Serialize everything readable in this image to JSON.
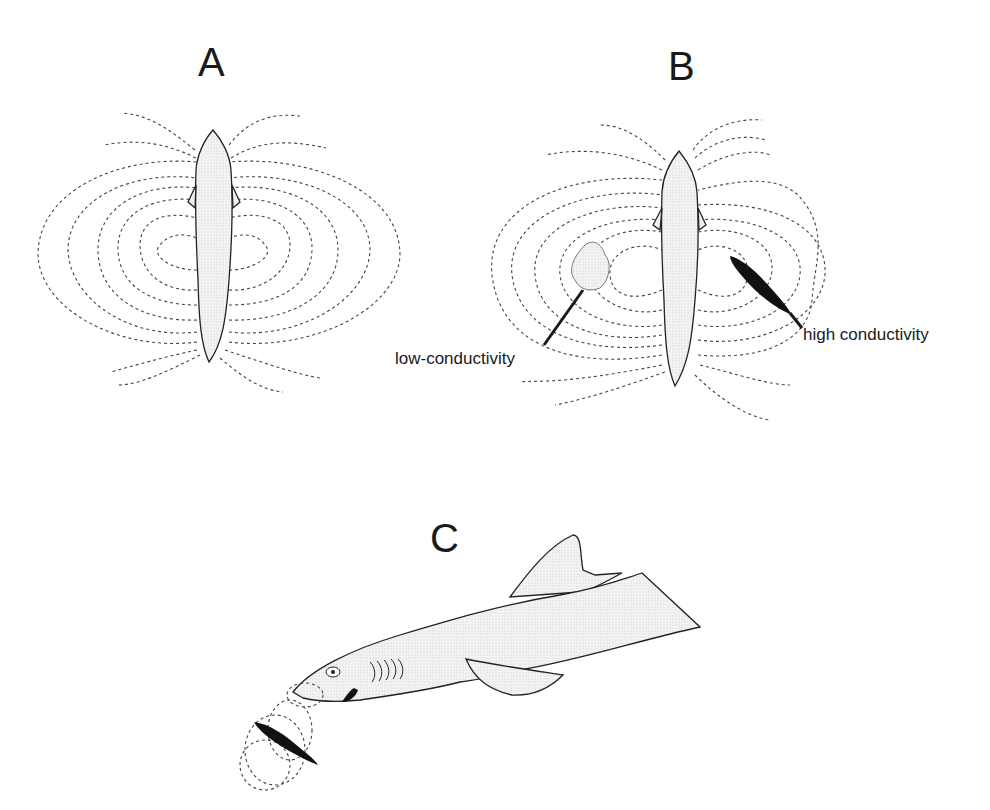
{
  "figure": {
    "panels": [
      {
        "id": "A",
        "label": "A",
        "description": "Dorsal view of a fish with a symmetric dipole electric field (dashed field lines)"
      },
      {
        "id": "B",
        "label": "B",
        "description": "Dorsal view of a fish whose electric field is distorted by nearby objects",
        "annotations": [
          {
            "text": "low-conductivity",
            "target": "stippled blob left of fish"
          },
          {
            "text": "high conductivity",
            "target": "dark fish-shaped object right of fish"
          }
        ]
      },
      {
        "id": "C",
        "label": "C",
        "description": "Lateral view of a shark detecting the bioelectric field of a small prey fish beneath its snout"
      }
    ]
  },
  "colors": {
    "ink": "#1a1a1a",
    "field_line": "#444444",
    "stipple": "#e8e8e8",
    "background": "#ffffff"
  }
}
